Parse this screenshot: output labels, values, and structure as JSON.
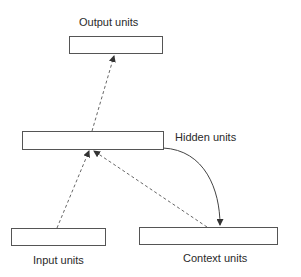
{
  "diagram": {
    "type": "simple-recurrent-network",
    "colors": {
      "stroke": "#555555",
      "text": "#2a2a2a",
      "background": "#ffffff"
    },
    "nodes": [
      {
        "id": "output",
        "label": "Output units"
      },
      {
        "id": "hidden",
        "label": "Hidden units"
      },
      {
        "id": "input",
        "label": "Input units"
      },
      {
        "id": "context",
        "label": "Context units"
      }
    ],
    "edges": [
      {
        "from": "input",
        "to": "hidden",
        "style": "dashed"
      },
      {
        "from": "context",
        "to": "hidden",
        "style": "dashed"
      },
      {
        "from": "hidden",
        "to": "output",
        "style": "dashed"
      },
      {
        "from": "hidden",
        "to": "context",
        "style": "solid-curved"
      }
    ]
  }
}
